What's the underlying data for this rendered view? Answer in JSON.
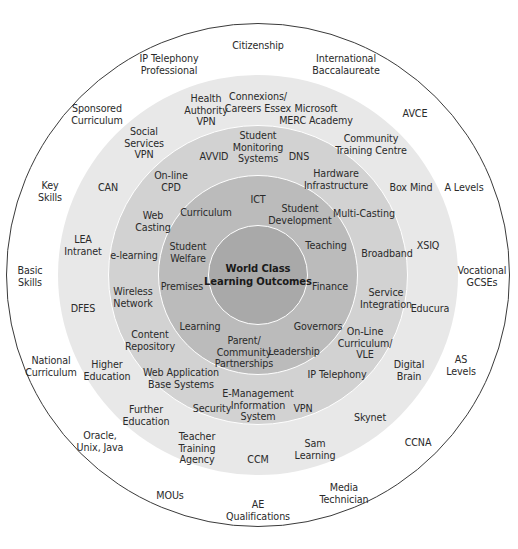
{
  "diagram": {
    "title": "World Class Learning Outcomes",
    "center": {
      "x": 258,
      "y": 275
    },
    "rings": [
      {
        "name": "outer-ring",
        "radius": 252,
        "fill": "#ffffff",
        "border": "#3a3a3a"
      },
      {
        "name": "ring-2",
        "radius": 200,
        "fill": "#e8e8e8",
        "border": "none"
      },
      {
        "name": "ring-3",
        "radius": 150,
        "fill": "#d2d2d2",
        "border": "#ffffff"
      },
      {
        "name": "ring-4",
        "radius": 100,
        "fill": "#bbbbbb",
        "border": "#ffffff"
      },
      {
        "name": "core",
        "radius": 50,
        "fill": "#a9a9a9",
        "border": "#ffffff"
      }
    ],
    "core_label": "World Class\nLearning Outcomes",
    "ring4_labels": [
      {
        "text": "ICT",
        "x": 258,
        "y": 200
      },
      {
        "text": "Curriculum",
        "x": 206,
        "y": 213
      },
      {
        "text": "Student\nDevelopment",
        "x": 300,
        "y": 214
      },
      {
        "text": "Student\nWelfare",
        "x": 188,
        "y": 252
      },
      {
        "text": "Teaching",
        "x": 326,
        "y": 246
      },
      {
        "text": "Premises",
        "x": 182,
        "y": 287
      },
      {
        "text": "Finance",
        "x": 330,
        "y": 287
      },
      {
        "text": "Learning",
        "x": 200,
        "y": 327
      },
      {
        "text": "Governors",
        "x": 318,
        "y": 327
      },
      {
        "text": "Parent/\nCommunity\nPartnerships",
        "x": 244,
        "y": 352
      },
      {
        "text": "Leadership",
        "x": 294,
        "y": 352
      }
    ],
    "ring3_labels": [
      {
        "text": "Student\nMonitoring\nSystems",
        "x": 258,
        "y": 147
      },
      {
        "text": "AVVID",
        "x": 214,
        "y": 157
      },
      {
        "text": "DNS",
        "x": 299,
        "y": 157
      },
      {
        "text": "On-line\nCPD",
        "x": 171,
        "y": 181
      },
      {
        "text": "Hardware\nInfrastructure",
        "x": 336,
        "y": 179
      },
      {
        "text": "Web\nCasting",
        "x": 153,
        "y": 221
      },
      {
        "text": "Multi-Casting",
        "x": 364,
        "y": 214
      },
      {
        "text": "e-learning",
        "x": 134,
        "y": 256
      },
      {
        "text": "Broadband",
        "x": 387,
        "y": 254
      },
      {
        "text": "Wireless\nNetwork",
        "x": 133,
        "y": 297
      },
      {
        "text": "Service\nIntegration",
        "x": 386,
        "y": 298
      },
      {
        "text": "Content\nRepository",
        "x": 150,
        "y": 340
      },
      {
        "text": "On-Line\nCurriculum/\nVLE",
        "x": 365,
        "y": 343
      },
      {
        "text": "Web Application\nBase Systems",
        "x": 181,
        "y": 378
      },
      {
        "text": "IP Telephony",
        "x": 337,
        "y": 375
      },
      {
        "text": "Security",
        "x": 212,
        "y": 409
      },
      {
        "text": "E-Management\nInformation\nSystem",
        "x": 258,
        "y": 405
      },
      {
        "text": "VPN",
        "x": 303,
        "y": 409
      }
    ],
    "ring2_labels": [
      {
        "text": "Connexions/\nCareers Essex",
        "x": 258,
        "y": 102
      },
      {
        "text": "Health\nAuthority\nVPN",
        "x": 206,
        "y": 110
      },
      {
        "text": "Microsoft\nMERC Academy",
        "x": 316,
        "y": 114
      },
      {
        "text": "Social\nServices\nVPN",
        "x": 144,
        "y": 143
      },
      {
        "text": "Community\nTraining Centre",
        "x": 371,
        "y": 144
      },
      {
        "text": "CAN",
        "x": 108,
        "y": 188
      },
      {
        "text": "Box Mind",
        "x": 411,
        "y": 188
      },
      {
        "text": "LEA\nIntranet",
        "x": 83,
        "y": 245
      },
      {
        "text": "XSIQ",
        "x": 428,
        "y": 246
      },
      {
        "text": "DFES",
        "x": 83,
        "y": 309
      },
      {
        "text": "Educura",
        "x": 430,
        "y": 309
      },
      {
        "text": "Higher\nEducation",
        "x": 107,
        "y": 370
      },
      {
        "text": "Digital\nBrain",
        "x": 409,
        "y": 370
      },
      {
        "text": "Further\nEducation",
        "x": 146,
        "y": 415
      },
      {
        "text": "Skynet",
        "x": 370,
        "y": 418
      },
      {
        "text": "Teacher\nTraining\nAgency",
        "x": 197,
        "y": 448
      },
      {
        "text": "CCM",
        "x": 258,
        "y": 460
      },
      {
        "text": "Sam\nLearning",
        "x": 315,
        "y": 449
      }
    ],
    "outer_labels": [
      {
        "text": "Citizenship",
        "x": 258,
        "y": 46
      },
      {
        "text": "IP Telephony\nProfessional",
        "x": 169,
        "y": 64
      },
      {
        "text": "International\nBaccalaureate",
        "x": 346,
        "y": 64
      },
      {
        "text": "Sponsored\nCurriculum",
        "x": 97,
        "y": 114
      },
      {
        "text": "AVCE",
        "x": 415,
        "y": 114
      },
      {
        "text": "Key\nSkills",
        "x": 50,
        "y": 191
      },
      {
        "text": "A Levels",
        "x": 464,
        "y": 188
      },
      {
        "text": "Basic\nSkills",
        "x": 30,
        "y": 276
      },
      {
        "text": "Vocational\nGCSEs",
        "x": 482,
        "y": 276
      },
      {
        "text": "National\nCurriculum",
        "x": 51,
        "y": 366
      },
      {
        "text": "AS\nLevels",
        "x": 461,
        "y": 365
      },
      {
        "text": "Oracle,\nUnix, Java",
        "x": 100,
        "y": 441
      },
      {
        "text": "CCNA",
        "x": 418,
        "y": 443
      },
      {
        "text": "MOUs",
        "x": 170,
        "y": 496
      },
      {
        "text": "Media\nTechnician",
        "x": 344,
        "y": 493
      },
      {
        "text": "AE\nQualifications",
        "x": 258,
        "y": 510
      }
    ]
  }
}
